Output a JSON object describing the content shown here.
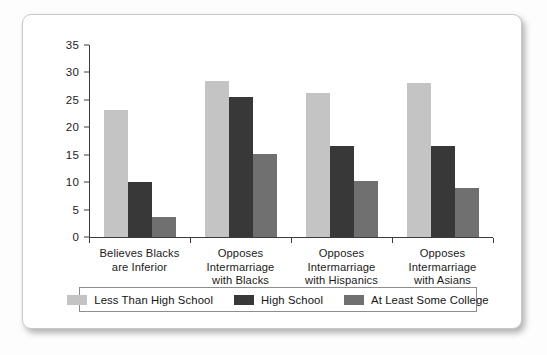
{
  "chart_data": {
    "type": "bar",
    "title": "",
    "subtitle": "",
    "xlabel": "",
    "ylabel": "",
    "ylim": [
      0,
      35
    ],
    "yticks": [
      0,
      5,
      10,
      15,
      20,
      25,
      30,
      35
    ],
    "grid": false,
    "legend_position": "bottom",
    "categories": [
      "Believes Blacks\nare Inferior",
      "Opposes\nIntermarriage\nwith Blacks",
      "Opposes\nIntermarriage\nwith Hispanics",
      "Opposes\nIntermarriage\nwith Asians"
    ],
    "category_lines": [
      [
        "Believes Blacks",
        "are Inferior"
      ],
      [
        "Opposes",
        "Intermarriage",
        "with Blacks"
      ],
      [
        "Opposes",
        "Intermarriage",
        "with Hispanics"
      ],
      [
        "Opposes",
        "Intermarriage",
        "with Asians"
      ]
    ],
    "series": [
      {
        "name": "Less Than High School",
        "color": "#c4c4c4",
        "values": [
          23.2,
          28.5,
          26.3,
          28.1
        ]
      },
      {
        "name": "High School",
        "color": "#383838",
        "values": [
          10.0,
          25.5,
          16.6,
          16.6
        ]
      },
      {
        "name": "At Least Some College",
        "color": "#707070",
        "values": [
          3.7,
          15.1,
          10.2,
          9.0
        ]
      }
    ]
  },
  "legend": {
    "items": [
      {
        "label": "Less Than High School",
        "color": "#c4c4c4"
      },
      {
        "label": "High School",
        "color": "#383838"
      },
      {
        "label": "At Least Some College",
        "color": "#707070"
      }
    ]
  },
  "axis": {
    "y_tick_labels": [
      "0",
      "5",
      "10",
      "15",
      "20",
      "25",
      "30",
      "35"
    ],
    "axis_color": "#3c3c3c"
  },
  "colors": {
    "card_background": "#ffffff",
    "page_background": "#fdfdfd",
    "card_border": "#c8c8c8",
    "text": "#1a1a1a"
  }
}
